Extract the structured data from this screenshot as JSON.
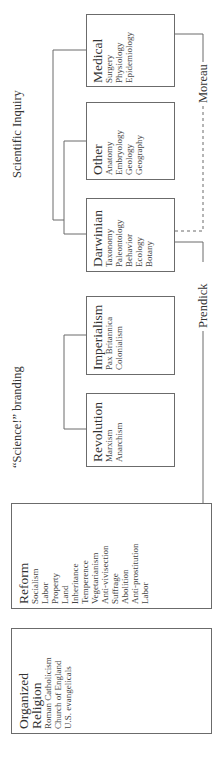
{
  "diagram": {
    "labels": {
      "scientific_inquiry": "Scientific Inquiry",
      "science_branding": "“Science!” branding",
      "moreau": "Moreau",
      "prendick": "Prendick"
    },
    "boxes": {
      "medical": {
        "title": "Medical",
        "items": [
          "Surgery",
          "Physiology",
          "Epidemiology"
        ]
      },
      "other": {
        "title": "Other",
        "items": [
          "Anatomy",
          "Embryology",
          "Geology",
          "Geography"
        ]
      },
      "darwinian": {
        "title": "Darwinian",
        "items": [
          "Taxonomy",
          "Paleontology",
          "Behavior",
          "Ecology",
          "Botany"
        ]
      },
      "imperialism": {
        "title": "Imperialism",
        "items": [
          "Pax Britannica",
          "Colonialism"
        ]
      },
      "revolution": {
        "title": "Revolution",
        "items": [
          "Marxism",
          "Anarchism"
        ]
      },
      "reform": {
        "title": "Reform",
        "items": [
          "Socialism",
          "Labor",
          "Property",
          "Land",
          "Inheritance",
          "Temperence",
          "Vegetarianism",
          "Anti-vivisection",
          "Suffrage",
          "Abolition",
          "Anti-prostitution",
          "Labor"
        ]
      },
      "organized_religion": {
        "title_line1": "Organized",
        "title_line2": "Religion",
        "items": [
          "Roman Catholicism",
          "Church of England",
          "U.S. evangelicals"
        ]
      }
    },
    "colors": {
      "line": "#6b6b6b",
      "text": "#333333"
    }
  }
}
